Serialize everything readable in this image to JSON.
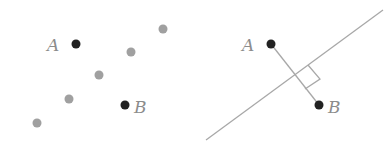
{
  "colors": {
    "highlight_point": "#222222",
    "other_point": "#a0a0a0",
    "label": "#8c8c8c",
    "line": "#a8a8a8"
  },
  "left_panel": {
    "labels": {
      "a": "A",
      "b": "B"
    },
    "points_highlight": [
      {
        "name": "A",
        "x": 76,
        "y": 44
      },
      {
        "name": "B",
        "x": 125,
        "y": 105
      }
    ],
    "points_other": [
      {
        "x": 163,
        "y": 29
      },
      {
        "x": 131,
        "y": 52
      },
      {
        "x": 99,
        "y": 75
      },
      {
        "x": 69,
        "y": 99
      },
      {
        "x": 37,
        "y": 123
      }
    ]
  },
  "right_panel": {
    "labels": {
      "a": "A",
      "b": "B"
    },
    "points_highlight": [
      {
        "name": "A",
        "x": 271,
        "y": 44
      },
      {
        "name": "B",
        "x": 319,
        "y": 105
      }
    ],
    "separating_line": {
      "x1": 206,
      "y1": 140,
      "x2": 383,
      "y2": 10
    },
    "segment_ab": {
      "x1": 271,
      "y1": 44,
      "x2": 319,
      "y2": 105
    },
    "right_angle_marker": true
  }
}
